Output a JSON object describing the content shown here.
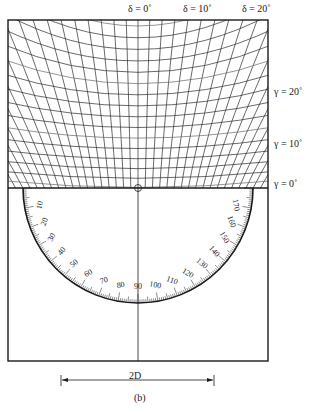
{
  "figure": {
    "caption": "(b)",
    "top_labels": [
      {
        "text": "δ = 0˚",
        "x": 128
      },
      {
        "text": "δ = 10˚",
        "x": 183
      },
      {
        "text": "δ = 20˚",
        "x": 242
      }
    ],
    "side_labels": [
      {
        "text": "γ = 20˚",
        "y": 92
      },
      {
        "text": "γ = 10˚",
        "y": 144
      },
      {
        "text": "γ = 0˚",
        "y": 184
      }
    ],
    "dimension_label": "2D",
    "protractor": {
      "tick_labels": [
        "10",
        "20",
        "30",
        "40",
        "50",
        "60",
        "70",
        "80",
        "90",
        "100",
        "110",
        "120",
        "130",
        "140",
        "150",
        "160",
        "170"
      ],
      "range_deg": [
        0,
        180
      ]
    },
    "colors": {
      "line": "#1a1a1a",
      "grid": "#2a2a2a",
      "background": "#ffffff"
    }
  }
}
